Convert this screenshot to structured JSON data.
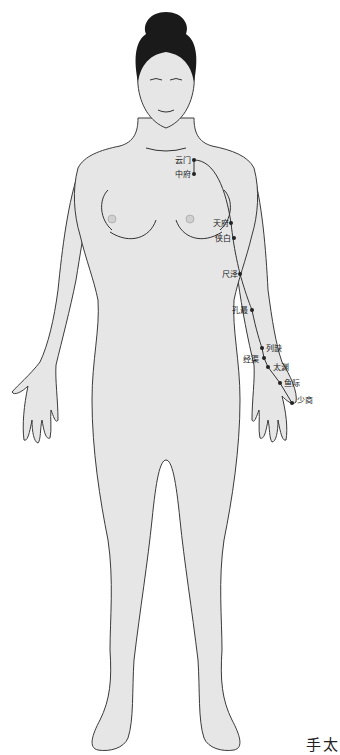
{
  "diagram": {
    "type": "acupuncture-meridian-chart",
    "meridian_caption": "手太",
    "colors": {
      "skin": "#e6e6e6",
      "outline": "#3a3a3a",
      "hair": "#1a1a1a",
      "point": "#222222",
      "meridian_line": "#333333"
    },
    "points": [
      {
        "name": "云门",
        "x": 194,
        "y": 160,
        "label_x": 175,
        "label_y": 156
      },
      {
        "name": "中府",
        "x": 194,
        "y": 174,
        "label_x": 175,
        "label_y": 170
      },
      {
        "name": "天府",
        "x": 231,
        "y": 223,
        "label_x": 213,
        "label_y": 219
      },
      {
        "name": "侠白",
        "x": 234,
        "y": 238,
        "label_x": 215,
        "label_y": 234
      },
      {
        "name": "尺泽",
        "x": 240,
        "y": 274,
        "label_x": 222,
        "label_y": 270
      },
      {
        "name": "孔最",
        "x": 252,
        "y": 310,
        "label_x": 232,
        "label_y": 306
      },
      {
        "name": "列缺",
        "x": 262,
        "y": 348,
        "label_x": 266,
        "label_y": 344
      },
      {
        "name": "经渠",
        "x": 264,
        "y": 358,
        "label_x": 243,
        "label_y": 355
      },
      {
        "name": "太渊",
        "x": 268,
        "y": 367,
        "label_x": 273,
        "label_y": 363
      },
      {
        "name": "鱼际",
        "x": 280,
        "y": 383,
        "label_x": 284,
        "label_y": 379
      },
      {
        "name": "少商",
        "x": 292,
        "y": 403,
        "label_x": 297,
        "label_y": 396
      }
    ]
  }
}
